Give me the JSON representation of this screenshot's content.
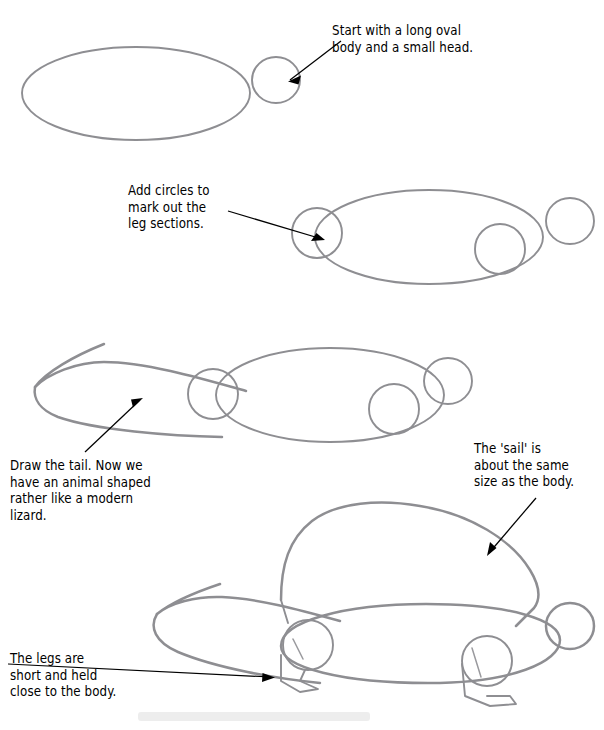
{
  "document": {
    "kind": "pencil-drawing-tutorial",
    "subject": "How to draw a Dimetrodon",
    "page_background": "#ffffff",
    "pencil_color": "#8e8e92",
    "ink_color": "#000000",
    "step_count": 4
  },
  "captions": {
    "step1": "Start with a long oval\nbody and a small head.",
    "step2": "Add circles to\nmark out the\nleg sections.",
    "step3": "Draw the tail. Now we\nhave an animal shaped\nrather like a modern\nlizard.",
    "sail": "The 'sail' is\nabout the same\nsize as the body.",
    "legs": "The legs are\nshort and held\nclose to the body."
  },
  "steps": [
    {
      "index": 1,
      "label": "step-1-oval-body-and-head",
      "caption_ref": "captions.step1",
      "shapes": [
        "body-oval",
        "head-circle"
      ],
      "annotation_arrow": "arrow-to-head"
    },
    {
      "index": 2,
      "label": "step-2-leg-circles",
      "caption_ref": "captions.step2",
      "shapes": [
        "body-oval",
        "head-circle",
        "front-leg-circle",
        "rear-leg-circle"
      ],
      "annotation_arrow": "arrow-to-leg-circle"
    },
    {
      "index": 3,
      "label": "step-3-tail",
      "caption_ref": "captions.step3",
      "shapes": [
        "body-oval",
        "head-circle",
        "front-leg-circle",
        "rear-leg-circle",
        "tail-curve"
      ],
      "annotation_arrow": "arrow-to-tail"
    },
    {
      "index": 4,
      "label": "step-4-sail-and-legs",
      "caption_ref": "captions.sail",
      "shapes": [
        "body-oval",
        "head-circle",
        "front-leg-circle",
        "rear-leg-circle",
        "tail-curve",
        "sail-arch",
        "front-foot",
        "rear-foot"
      ],
      "annotation_arrows": [
        "arrow-to-sail",
        "arrow-to-legs"
      ]
    }
  ]
}
